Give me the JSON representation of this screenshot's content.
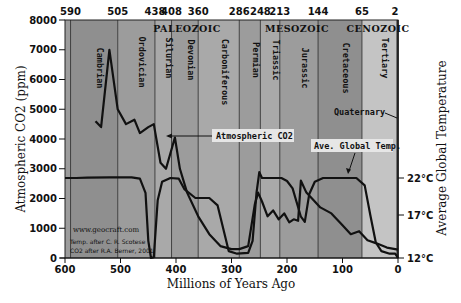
{
  "chart_data": {
    "type": "line",
    "title": "",
    "xlabel": "Millions of Years Ago",
    "ylabel": "Atmospheric CO2 (ppm)",
    "y2label": "Average Global Temperature",
    "xlim": [
      600,
      0
    ],
    "ylim": [
      0,
      8000
    ],
    "y2lim": [
      12,
      22
    ],
    "x_ticks": [
      600,
      500,
      400,
      300,
      200,
      100,
      0
    ],
    "y_ticks": [
      0,
      1000,
      2000,
      3000,
      4000,
      5000,
      6000,
      7000,
      8000
    ],
    "y2_ticks": [
      {
        "label": "12°C",
        "value": 12
      },
      {
        "label": "17°C",
        "value": 17
      },
      {
        "label": "22°C",
        "value": 22
      }
    ],
    "top_ticks": [
      590,
      505,
      438,
      408,
      360,
      286,
      248,
      213,
      144,
      65,
      2
    ],
    "eras": [
      {
        "name": "PALEOZOIC",
        "start": 590,
        "end": 248
      },
      {
        "name": "MESOZOIC",
        "start": 248,
        "end": 65
      },
      {
        "name": "CENOZOIC",
        "start": 65,
        "end": 0
      }
    ],
    "periods": [
      {
        "name": "Cambrian",
        "start": 590,
        "end": 505
      },
      {
        "name": "Ordovician",
        "start": 505,
        "end": 438
      },
      {
        "name": "Silurian",
        "start": 438,
        "end": 408
      },
      {
        "name": "Devonian",
        "start": 408,
        "end": 360
      },
      {
        "name": "Carboniferous",
        "start": 360,
        "end": 286
      },
      {
        "name": "Permian",
        "start": 286,
        "end": 248
      },
      {
        "name": "Triassic",
        "start": 248,
        "end": 213
      },
      {
        "name": "Jurassic",
        "start": 213,
        "end": 144
      },
      {
        "name": "Cretaceous",
        "start": 144,
        "end": 65
      },
      {
        "name": "Tertiary",
        "start": 65,
        "end": 2
      },
      {
        "name": "Quaternary",
        "start": 2,
        "end": 0
      }
    ],
    "series": [
      {
        "name": "Atmospheric CO2",
        "axis": "left",
        "unit": "ppm",
        "points": [
          [
            545,
            4600
          ],
          [
            535,
            4400
          ],
          [
            520,
            7000
          ],
          [
            505,
            5000
          ],
          [
            490,
            4500
          ],
          [
            475,
            4650
          ],
          [
            465,
            4200
          ],
          [
            450,
            4400
          ],
          [
            440,
            4500
          ],
          [
            428,
            3200
          ],
          [
            418,
            3000
          ],
          [
            402,
            4050
          ],
          [
            393,
            3000
          ],
          [
            380,
            2200
          ],
          [
            360,
            1400
          ],
          [
            340,
            800
          ],
          [
            320,
            400
          ],
          [
            300,
            300
          ],
          [
            286,
            300
          ],
          [
            270,
            400
          ],
          [
            258,
            1800
          ],
          [
            252,
            2200
          ],
          [
            245,
            1900
          ],
          [
            235,
            1400
          ],
          [
            225,
            1600
          ],
          [
            215,
            1300
          ],
          [
            205,
            1500
          ],
          [
            196,
            1200
          ],
          [
            188,
            1300
          ],
          [
            180,
            1250
          ],
          [
            175,
            2600
          ],
          [
            165,
            2200
          ],
          [
            155,
            2000
          ],
          [
            140,
            1700
          ],
          [
            120,
            1500
          ],
          [
            100,
            1100
          ],
          [
            85,
            800
          ],
          [
            70,
            900
          ],
          [
            55,
            600
          ],
          [
            40,
            500
          ],
          [
            20,
            350
          ],
          [
            5,
            300
          ],
          [
            0,
            280
          ]
        ]
      },
      {
        "name": "Ave. Global Temp.",
        "axis": "right",
        "unit": "°C",
        "points": [
          [
            600,
            22
          ],
          [
            580,
            22
          ],
          [
            560,
            22.05
          ],
          [
            520,
            22.1
          ],
          [
            500,
            22.1
          ],
          [
            480,
            22.1
          ],
          [
            465,
            21.9
          ],
          [
            455,
            20
          ],
          [
            450,
            14
          ],
          [
            445,
            12
          ],
          [
            440,
            12.1
          ],
          [
            433,
            19
          ],
          [
            425,
            21.5
          ],
          [
            410,
            22
          ],
          [
            395,
            21.9
          ],
          [
            385,
            20.5
          ],
          [
            365,
            19.3
          ],
          [
            340,
            19.3
          ],
          [
            325,
            18.3
          ],
          [
            305,
            12.8
          ],
          [
            290,
            12.5
          ],
          [
            270,
            12.6
          ],
          [
            262,
            14
          ],
          [
            255,
            20
          ],
          [
            250,
            22.8
          ],
          [
            245,
            22
          ],
          [
            230,
            22
          ],
          [
            210,
            22
          ],
          [
            200,
            21.6
          ],
          [
            190,
            20.6
          ],
          [
            175,
            16.8
          ],
          [
            168,
            16.2
          ],
          [
            160,
            19.8
          ],
          [
            150,
            21.5
          ],
          [
            135,
            22
          ],
          [
            110,
            22
          ],
          [
            75,
            22
          ],
          [
            60,
            21
          ],
          [
            50,
            17
          ],
          [
            40,
            13.8
          ],
          [
            30,
            12.8
          ],
          [
            15,
            12.5
          ],
          [
            5,
            12.5
          ],
          [
            0,
            12
          ]
        ]
      }
    ],
    "annotations": [
      {
        "text": "Atmospheric CO2",
        "target_series": "Atmospheric CO2"
      },
      {
        "text": "Ave. Global Temp.",
        "target_series": "Ave. Global Temp."
      },
      {
        "text": "Quaternary"
      }
    ],
    "credits": [
      "www.geocraft.com",
      "Temp. after C. R. Scotese",
      "CO2 after R.A. Berner, 2001"
    ],
    "grid": false,
    "legend_position": "none"
  },
  "style": {
    "band_dark": "#8f8f8f",
    "band_mid": "#9c9c9c",
    "band_light": "#a9a9a9",
    "band_cenozoic": "#c4c4c4",
    "line_color": "#111111",
    "callout_bg": "#e6e6e6"
  },
  "labels": {
    "xlabel": "Millions of Years Ago",
    "ylabel": "Atmospheric CO2 (ppm)",
    "y2label": "Average Global Temperature",
    "co2_callout": "Atmospheric CO2",
    "temp_callout": "Ave. Global Temp.",
    "quaternary": "Quaternary",
    "credit_web": "www.geocraft.com",
    "credit_temp": "Temp. after C. R. Scotese",
    "credit_co2": "CO2 after R.A. Berner, 2001"
  }
}
